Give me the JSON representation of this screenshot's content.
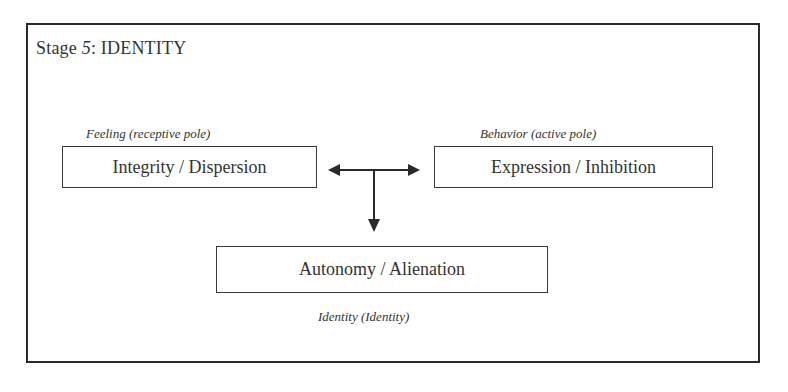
{
  "diagram": {
    "title_prefix": "Stage ",
    "title_number": "5",
    "title_suffix": ": IDENTITY",
    "nodes": [
      {
        "id": "feeling",
        "label": "Integrity / Dispersion",
        "pole_label": "Feeling (receptive pole)"
      },
      {
        "id": "behavior",
        "label": "Expression / Inhibition",
        "pole_label": "Behavior (active pole)"
      },
      {
        "id": "identity",
        "label": "Autonomy / Alienation",
        "pole_label": "Identity  (Identity)"
      }
    ],
    "edges": [
      {
        "from": "feeling",
        "to": "behavior",
        "type": "bidirectional"
      },
      {
        "from": "junction",
        "to": "identity",
        "type": "directed"
      }
    ],
    "colors": {
      "line": "#2a2a2a",
      "text": "#333333",
      "background": "#ffffff"
    }
  }
}
